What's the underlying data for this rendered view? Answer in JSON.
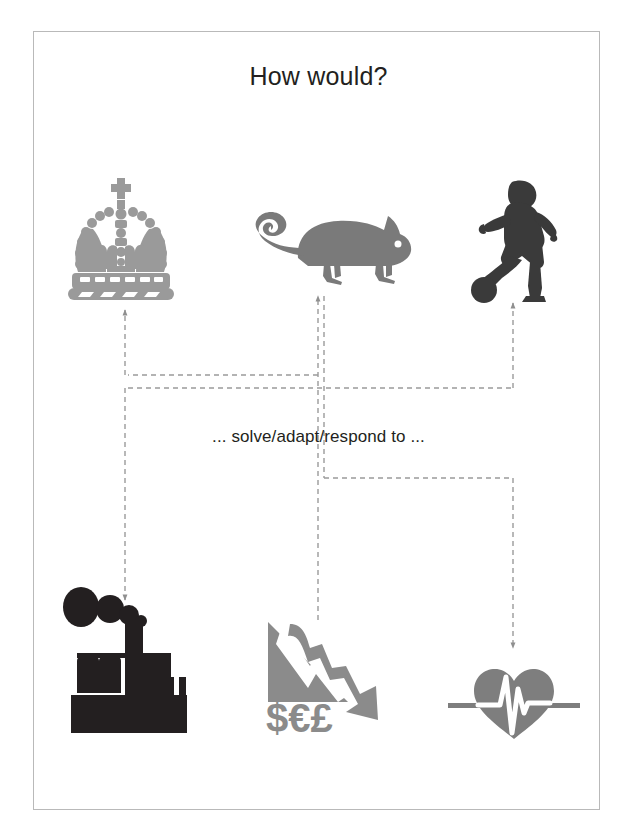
{
  "slide": {
    "title": "How would?",
    "middle_label": "... solve/adapt/respond to ...",
    "background": "#ffffff",
    "border_color": "#b9b9b9",
    "text_color": "#231f20"
  },
  "palette": {
    "light_gray": "#9a9a9a",
    "mid_gray": "#7a7a7a",
    "dark_gray": "#6f6f6f",
    "near_black": "#3a3a3a",
    "wire_gray": "#9b9b9b"
  },
  "top_icons": [
    {
      "name": "crown-icon",
      "label": "crown",
      "color": "#9a9a9a",
      "x": 62,
      "y": 176
    },
    {
      "name": "chameleon-icon",
      "label": "chameleon",
      "color": "#7a7a7a",
      "x": 238,
      "y": 196
    },
    {
      "name": "footballer-icon",
      "label": "footballer",
      "color": "#3a3a3a",
      "x": 466,
      "y": 178
    }
  ],
  "bottom_icons": [
    {
      "name": "factory-icon",
      "label": "factory",
      "color": "#231f20",
      "x": 63,
      "y": 585
    },
    {
      "name": "financial-decline-icon",
      "label": "financial decline",
      "color": "#8b8b8b",
      "x": 258,
      "y": 608,
      "currency": "$€£"
    },
    {
      "name": "heart-monitor-icon",
      "label": "heart monitor",
      "color": "#7e7e7e",
      "x": 448,
      "y": 655
    }
  ],
  "connectors": [
    {
      "name": "factory-to-crown",
      "from": "factory-icon",
      "to": "crown-icon",
      "style": "dashed-arrow"
    },
    {
      "name": "finance-to-chameleon",
      "from": "financial-decline-icon",
      "to": "chameleon-icon",
      "style": "dashed-arrow"
    },
    {
      "name": "heart-to-footballer",
      "from": "heart-monitor-icon",
      "to": "footballer-icon",
      "style": "dashed-arrow"
    },
    {
      "name": "crown-to-finance",
      "from": "crown-icon",
      "to": "financial-decline-icon",
      "style": "dashed-arrow"
    },
    {
      "name": "chameleon-to-factory",
      "from": "chameleon-icon",
      "to": "factory-icon",
      "style": "dashed-arrow"
    },
    {
      "name": "footballer-to-heart",
      "from": "footballer-icon",
      "to": "heart-monitor-icon",
      "style": "dashed-arrow"
    }
  ]
}
